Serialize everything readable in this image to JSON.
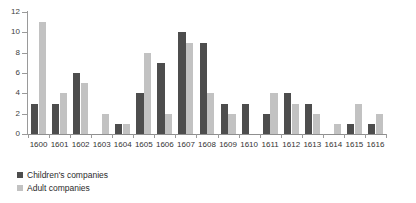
{
  "chart_data": {
    "type": "bar",
    "title": "",
    "subtitle": "",
    "xlabel": "",
    "ylabel": "",
    "ylim": [
      0,
      12
    ],
    "yticks": [
      0,
      2,
      4,
      6,
      8,
      10,
      12
    ],
    "grid": false,
    "legend_position": "bottom-left",
    "categories": [
      "1600",
      "1601",
      "1602",
      "1603",
      "1604",
      "1605",
      "1606",
      "1607",
      "1608",
      "1609",
      "1610",
      "1611",
      "1612",
      "1613",
      "1614",
      "1615",
      "1616"
    ],
    "series": [
      {
        "name": "Children's companies",
        "color": "#4d4d4d",
        "values": [
          3,
          3,
          6,
          0,
          1,
          4,
          7,
          10,
          9,
          3,
          3,
          2,
          4,
          3,
          0,
          1,
          1
        ]
      },
      {
        "name": "Adult companies",
        "color": "#c2c2c2",
        "values": [
          11,
          4,
          5,
          2,
          1,
          8,
          2,
          9,
          4,
          2,
          0,
          4,
          3,
          2,
          1,
          3,
          2
        ]
      }
    ]
  },
  "legend": {
    "items": [
      {
        "label": "Children's companies"
      },
      {
        "label": "Adult companies"
      }
    ]
  }
}
